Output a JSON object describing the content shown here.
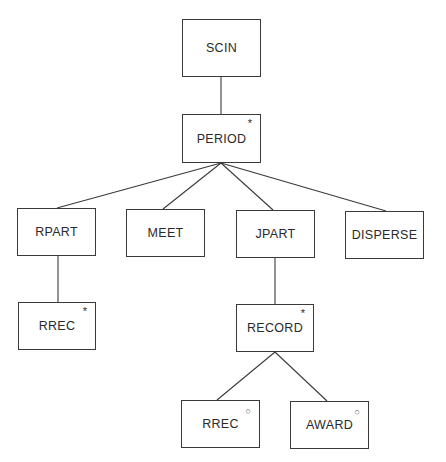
{
  "diagram": {
    "type": "tree",
    "nodes": [
      {
        "id": "scin",
        "label": "SCIN",
        "marker": "",
        "x": 182,
        "y": 19,
        "w": 79,
        "h": 58
      },
      {
        "id": "period",
        "label": "PERIOD",
        "marker": "*",
        "x": 182,
        "y": 114,
        "w": 79,
        "h": 49
      },
      {
        "id": "rpart",
        "label": "RPART",
        "marker": "",
        "x": 17,
        "y": 208,
        "w": 79,
        "h": 48
      },
      {
        "id": "meet",
        "label": "MEET",
        "marker": "",
        "x": 126,
        "y": 209,
        "w": 79,
        "h": 48
      },
      {
        "id": "jpart",
        "label": "JPART",
        "marker": "",
        "x": 236,
        "y": 210,
        "w": 79,
        "h": 48
      },
      {
        "id": "disperse",
        "label": "DISPERSE",
        "marker": "",
        "x": 345,
        "y": 211,
        "w": 79,
        "h": 48
      },
      {
        "id": "rrec1",
        "label": "RREC",
        "marker": "*",
        "x": 18,
        "y": 302,
        "w": 78,
        "h": 48
      },
      {
        "id": "record",
        "label": "RECORD",
        "marker": "*",
        "x": 236,
        "y": 304,
        "w": 78,
        "h": 48
      },
      {
        "id": "rrec2",
        "label": "RREC",
        "marker": "○",
        "x": 181,
        "y": 400,
        "w": 79,
        "h": 48
      },
      {
        "id": "award",
        "label": "AWARD",
        "marker": "○",
        "x": 290,
        "y": 401,
        "w": 79,
        "h": 48
      }
    ],
    "edges": [
      {
        "from": "scin",
        "to": "period",
        "x1": 221,
        "y1": 77,
        "x2": 221,
        "y2": 114
      },
      {
        "from": "period",
        "to": "rpart",
        "x1": 221,
        "y1": 163,
        "x2": 57,
        "y2": 208
      },
      {
        "from": "period",
        "to": "meet",
        "x1": 221,
        "y1": 163,
        "x2": 163,
        "y2": 209
      },
      {
        "from": "period",
        "to": "jpart",
        "x1": 221,
        "y1": 163,
        "x2": 273,
        "y2": 210
      },
      {
        "from": "period",
        "to": "disperse",
        "x1": 221,
        "y1": 163,
        "x2": 386,
        "y2": 211
      },
      {
        "from": "rpart",
        "to": "rrec1",
        "x1": 58,
        "y1": 256,
        "x2": 58,
        "y2": 302
      },
      {
        "from": "jpart",
        "to": "record",
        "x1": 275,
        "y1": 258,
        "x2": 275,
        "y2": 304
      },
      {
        "from": "record",
        "to": "rrec2",
        "x1": 275,
        "y1": 352,
        "x2": 217,
        "y2": 400
      },
      {
        "from": "record",
        "to": "award",
        "x1": 275,
        "y1": 352,
        "x2": 327,
        "y2": 401
      }
    ],
    "markers": {
      "iteration": "*",
      "selection": "○"
    },
    "colors": {
      "line": "#3a3a3a",
      "text": "#2a2a2a",
      "background": "#ffffff"
    }
  }
}
